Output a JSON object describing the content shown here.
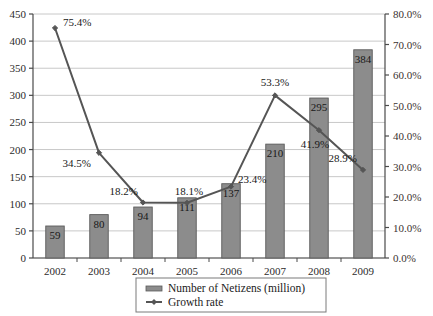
{
  "chart_data": {
    "type": "bar",
    "title": "",
    "subtitle": "",
    "xlabel": "",
    "ylabel": "",
    "y2label": "",
    "grid": true,
    "legend_position": "bottom-center",
    "categories": [
      "2002",
      "2003",
      "2004",
      "2005",
      "2006",
      "2007",
      "2008",
      "2009"
    ],
    "series": [
      {
        "name": "Number of Netizens (million)",
        "type": "bar",
        "axis": "left",
        "color": "#8c8c8c",
        "border_color": "#5a5a5a",
        "values": [
          59,
          80,
          94,
          111,
          137,
          210,
          295,
          384
        ],
        "labels": [
          "59",
          "80",
          "94",
          "111",
          "137",
          "210",
          "295",
          "384"
        ]
      },
      {
        "name": "Growth rate",
        "type": "line",
        "axis": "right",
        "color": "#555555",
        "marker": "diamond",
        "values": [
          75.4,
          34.5,
          18.2,
          18.1,
          23.4,
          53.3,
          41.9,
          28.9
        ],
        "labels": [
          "75.4%",
          "34.5%",
          "18.2%",
          "18.1%",
          "23.4%",
          "53.3%",
          "41.9%",
          "28.9%"
        ]
      }
    ],
    "ylim": [
      0,
      450
    ],
    "ytick_step": 50,
    "yticks": [
      "0",
      "50",
      "100",
      "150",
      "200",
      "250",
      "300",
      "350",
      "400",
      "450"
    ],
    "y2lim": [
      0,
      80
    ],
    "y2tick_step": 10,
    "y2ticks": [
      "0.0%",
      "10.0%",
      "20.0%",
      "30.0%",
      "40.0%",
      "50.0%",
      "60.0%",
      "70.0%",
      "80.0%"
    ]
  },
  "legend": {
    "items": [
      {
        "label": "Number of Netizens (million)",
        "marker": "bar-swatch"
      },
      {
        "label": "Growth rate",
        "marker": "line-marker"
      }
    ]
  },
  "colors": {
    "bar_fill": "#8c8c8c",
    "bar_stroke": "#5a5a5a",
    "line": "#555555",
    "gridline": "#c8c8c8",
    "axis": "#4a4a4a",
    "background": "#ffffff"
  }
}
